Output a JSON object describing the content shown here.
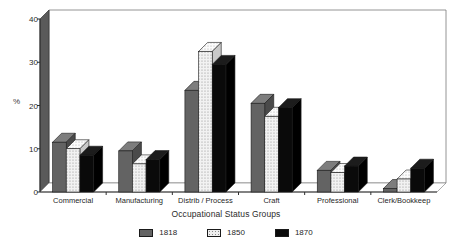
{
  "chart_data": {
    "type": "bar",
    "title": "",
    "xlabel": "Occupational Status Groups",
    "ylabel": "%",
    "ylim": [
      0,
      40
    ],
    "yticks": [
      0,
      10,
      20,
      30,
      40
    ],
    "grid": false,
    "legend_position": "bottom",
    "categories": [
      "Commercial",
      "Manufacturing",
      "Distrib / Process",
      "Craft",
      "Professional",
      "Clerk/Bookkeep"
    ],
    "series": [
      {
        "name": "1818",
        "color": "#636363",
        "values": [
          11.5,
          9.5,
          23.5,
          20.5,
          5.0,
          0.8
        ]
      },
      {
        "name": "1850",
        "color": "#efefef",
        "values": [
          10.0,
          6.5,
          32.5,
          17.5,
          4.5,
          3.0
        ]
      },
      {
        "name": "1870",
        "color": "#0a0a0a",
        "values": [
          8.5,
          7.5,
          29.5,
          19.5,
          6.0,
          5.5
        ]
      }
    ]
  }
}
